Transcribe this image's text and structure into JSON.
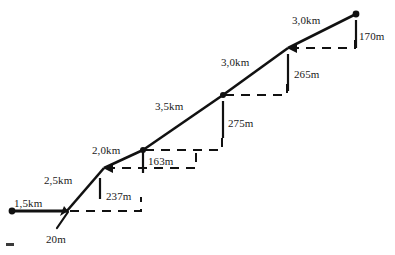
{
  "diagram": {
    "background_color": "#ffffff",
    "line_color": "#111111",
    "text_color": "#1a1a1a",
    "nodes": [
      {
        "name": "origin",
        "x": 12,
        "y": 211
      },
      {
        "name": "node-1",
        "x": 68,
        "y": 211
      },
      {
        "name": "node-2",
        "x": 104,
        "y": 168
      },
      {
        "name": "node-3",
        "x": 143,
        "y": 150
      },
      {
        "name": "node-4",
        "x": 223,
        "y": 95
      },
      {
        "name": "node-5",
        "x": 288,
        "y": 48
      },
      {
        "name": "summit",
        "x": 356,
        "y": 14
      }
    ],
    "slope_labels": [
      {
        "id": "slope-1",
        "text": "1,5km",
        "x": 14,
        "y": 197
      },
      {
        "id": "slope-2",
        "text": "2,5km",
        "x": 44,
        "y": 174
      },
      {
        "id": "slope-3",
        "text": "2,0km",
        "x": 92,
        "y": 144
      },
      {
        "id": "slope-4",
        "text": "3,5km",
        "x": 155,
        "y": 100
      },
      {
        "id": "slope-5",
        "text": "3,0km",
        "x": 221,
        "y": 56
      },
      {
        "id": "slope-6",
        "text": "3,0km",
        "x": 292,
        "y": 14
      }
    ],
    "rise_labels": [
      {
        "id": "rise-1",
        "text": "20m",
        "x": 46,
        "y": 233
      },
      {
        "id": "rise-2",
        "text": "237m",
        "x": 106,
        "y": 190
      },
      {
        "id": "rise-3",
        "text": "163m",
        "x": 148,
        "y": 155
      },
      {
        "id": "rise-4",
        "text": "275m",
        "x": 228,
        "y": 117
      },
      {
        "id": "rise-5",
        "text": "265m",
        "x": 294,
        "y": 68
      },
      {
        "id": "rise-6",
        "text": "170m",
        "x": 359,
        "y": 30
      }
    ],
    "measures": [
      {
        "id": "measure-20m",
        "distance": "1,5km",
        "rise": "20m"
      },
      {
        "id": "measure-237m",
        "distance": "2,5km",
        "rise": "237m"
      },
      {
        "id": "measure-163m",
        "distance": "2,0km",
        "rise": "163m"
      },
      {
        "id": "measure-275m",
        "distance": "3,5km",
        "rise": "275m"
      },
      {
        "id": "measure-265m",
        "distance": "3,0km",
        "rise": "265m"
      },
      {
        "id": "measure-170m",
        "distance": "3,0km",
        "rise": "170m"
      }
    ],
    "dashed_guides": [
      {
        "id": "guide-1",
        "x1": 68,
        "x2": 143,
        "y": 211,
        "drop_x": 143,
        "drop_y2": 196
      },
      {
        "id": "guide-2",
        "x1": 104,
        "x2": 196,
        "y": 168,
        "drop_x": 196,
        "drop_y2": 152
      },
      {
        "id": "guide-3",
        "x1": 143,
        "x2": 223,
        "y": 150,
        "drop_x": 223,
        "drop_y2": 136
      },
      {
        "id": "guide-4",
        "x1": 223,
        "x2": 288,
        "y": 95,
        "drop_x": 288,
        "drop_y2": 80
      },
      {
        "id": "guide-5",
        "x1": 288,
        "x2": 356,
        "y": 48,
        "drop_x": 356,
        "drop_y2": 33
      }
    ],
    "tick_bars": [
      {
        "id": "tick-237m",
        "x": 100,
        "y1": 176,
        "y2": 200
      },
      {
        "id": "tick-163m",
        "x": 143,
        "y1": 150,
        "y2": 175
      },
      {
        "id": "tick-275m",
        "x": 223,
        "y1": 99,
        "y2": 140
      },
      {
        "id": "tick-265m",
        "x": 288,
        "y1": 52,
        "y2": 93
      },
      {
        "id": "tick-170m",
        "x": 356,
        "y1": 18,
        "y2": 50
      }
    ]
  }
}
